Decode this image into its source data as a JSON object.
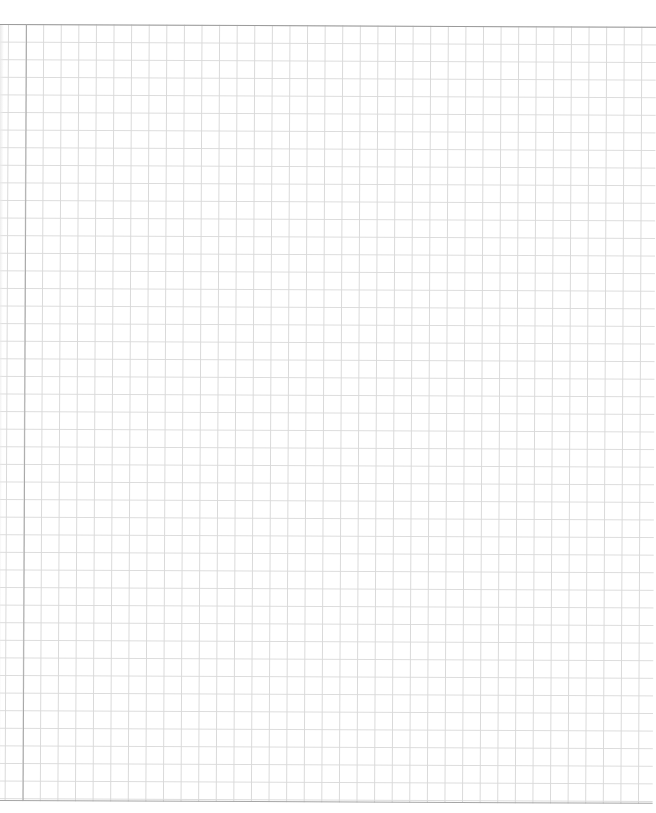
{
  "page": {
    "background_color": "#ffffff",
    "grid_color": "#d9d9d9",
    "border_color": "#9a9a9a",
    "margin_line_color": "#a8a8a8",
    "grid_cell_px": 17.6
  }
}
